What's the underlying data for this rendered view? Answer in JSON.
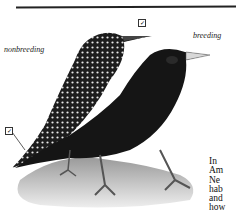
{
  "labels": {
    "nonbreeding": "nonbreeding",
    "breeding": "breeding"
  },
  "checkmarks": [
    "check-box-icon",
    "check-box-icon"
  ],
  "body_text_lines": [
    "In",
    "Am",
    "Ne",
    "hab",
    "and",
    "how"
  ],
  "colors": {
    "ink": "#111111",
    "background": "#ffffff"
  }
}
